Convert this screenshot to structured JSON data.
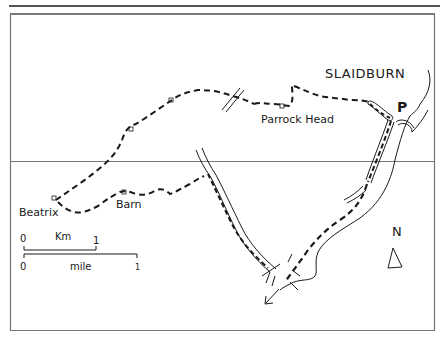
{
  "map": {
    "labels": {
      "town": "SLAIDBURN",
      "parking": "P",
      "parrock_head": "Parrock Head",
      "beatrix": "Beatrix",
      "barn": "Barn",
      "north": "N"
    },
    "scale_bar": {
      "km_label": "Km",
      "km_start": "0",
      "km_end": "1",
      "mile_label": "mile",
      "mile_start": "0",
      "mile_end": "1"
    },
    "legend_icons": {
      "route": "dashed-route-line",
      "road": "double-line-road",
      "river": "thin-line-river",
      "building": "small-square-building",
      "north_arrow": "triangle-north-arrow",
      "direction_arrow": "arrow-southwest"
    },
    "colors": {
      "ink": "#1a1a1a",
      "frame": "#777777",
      "background": "#ffffff"
    }
  }
}
